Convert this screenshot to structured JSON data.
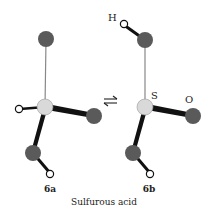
{
  "figure": {
    "caption": "Sulfurous acid",
    "structures": [
      {
        "id": "6a",
        "label": "6a"
      },
      {
        "id": "6b",
        "label": "6b"
      }
    ],
    "atom_labels": {
      "H": "H",
      "S": "S",
      "O": "O"
    },
    "equilibrium_symbol": "⇌",
    "colors": {
      "oxygen": "#5a5a5a",
      "sulfur": "#d9d9d9",
      "hydrogen": "#ffffff",
      "bond": "#111111",
      "thin_bond": "#777777"
    }
  }
}
